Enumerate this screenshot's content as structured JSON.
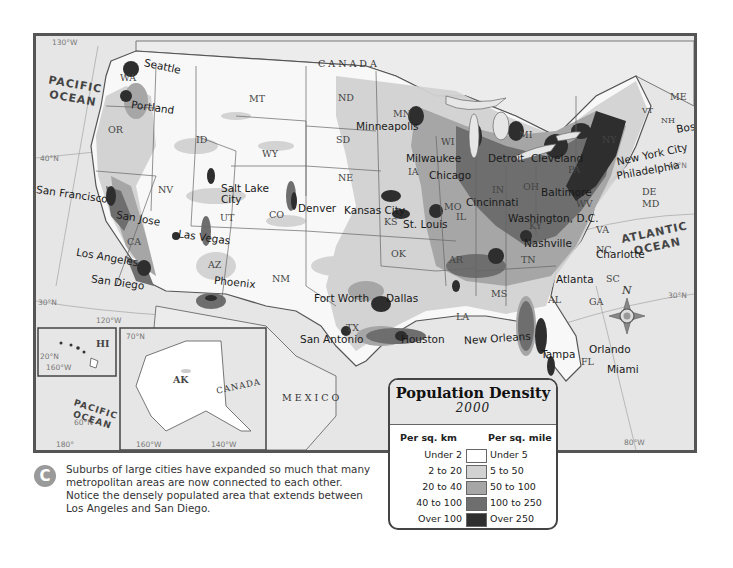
{
  "map": {
    "title": "Population Density",
    "year": "2000",
    "countries": {
      "canada": "CANADA",
      "mexico": "MEXICO",
      "canada_inset": "CANADA"
    },
    "oceans": {
      "pacific": "PACIFIC OCEAN",
      "pacific_inset": "PACIFIC OCEAN",
      "atlantic": "ATLANTIC OCEAN",
      "gulf": "Gulf of Mexico"
    },
    "graticule": {
      "lon_130": "130°W",
      "lat_40_w": "40°N",
      "lat_30_w": "30°N",
      "lon_120": "120°W",
      "lat_40_e": "40°N",
      "lat_30_e": "30°N",
      "lon_80": "80°W",
      "hi_lat_20": "20°N",
      "hi_lon_160": "160°W",
      "ak_lat_70": "70°N",
      "ak_lat_60": "60°N",
      "ak_lon_180": "180°",
      "ak_lon_160": "160°W",
      "ak_lon_140": "140°W"
    },
    "states": [
      "WA",
      "OR",
      "ID",
      "MT",
      "WY",
      "ND",
      "SD",
      "NE",
      "MN",
      "WI",
      "MI",
      "IA",
      "IL",
      "IN",
      "OH",
      "PA",
      "NY",
      "VT",
      "NH",
      "ME",
      "MA",
      "RI",
      "CT",
      "NJ",
      "DE",
      "MD",
      "WV",
      "VA",
      "KY",
      "TN",
      "NC",
      "SC",
      "GA",
      "AL",
      "MS",
      "AR",
      "LA",
      "MO",
      "KS",
      "OK",
      "TX",
      "NM",
      "AZ",
      "UT",
      "NV",
      "CA",
      "CO",
      "FL",
      "HI",
      "AK"
    ],
    "cities": {
      "seattle": "Seattle",
      "portland": "Portland",
      "san_francisco": "San Francisco",
      "san_jose": "San Jose",
      "los_angeles": "Los Angeles",
      "san_diego": "San Diego",
      "las_vegas": "Las Vegas",
      "salt_lake_city": "Salt Lake City",
      "phoenix": "Phoenix",
      "denver": "Denver",
      "minneapolis": "Minneapolis",
      "milwaukee": "Milwaukee",
      "chicago": "Chicago",
      "detroit": "Detroit",
      "cleveland": "Cleveland",
      "kansas_city": "Kansas City",
      "st_louis": "St. Louis",
      "cincinnati": "Cincinnati",
      "washington_dc": "Washington, D.C.",
      "baltimore": "Baltimore",
      "philadelphia": "Philadelphia",
      "new_york_city": "New York City",
      "boston": "Boston",
      "nashville": "Nashville",
      "charlotte": "Charlotte",
      "atlanta": "Atlanta",
      "fort_worth": "Fort Worth",
      "dallas": "Dallas",
      "san_antonio": "San Antonio",
      "houston": "Houston",
      "new_orleans": "New Orleans",
      "tampa": "Tampa",
      "orlando": "Orlando",
      "miami": "Miami"
    },
    "compass_label": "N"
  },
  "legend": {
    "title": "Population Density",
    "year": "2000",
    "col_km": "Per sq. km",
    "col_mile": "Per sq. mile",
    "rows": [
      {
        "km": "Under 2",
        "mile": "Under 5",
        "color": "#ffffff"
      },
      {
        "km": "2 to 20",
        "mile": "5 to 50",
        "color": "#d2d2d2"
      },
      {
        "km": "20 to 40",
        "mile": "50 to 100",
        "color": "#a6a6a6"
      },
      {
        "km": "40 to 100",
        "mile": "100 to 250",
        "color": "#6e6e6e"
      },
      {
        "km": "Over 100",
        "mile": "Over 250",
        "color": "#2e2e2e"
      }
    ]
  },
  "caption": {
    "badge": "C",
    "text": "Suburbs of large cities have expanded so much that many metropolitan areas are now connected to each other. Notice the densely populated area that extends between Los Angeles and San Diego."
  }
}
